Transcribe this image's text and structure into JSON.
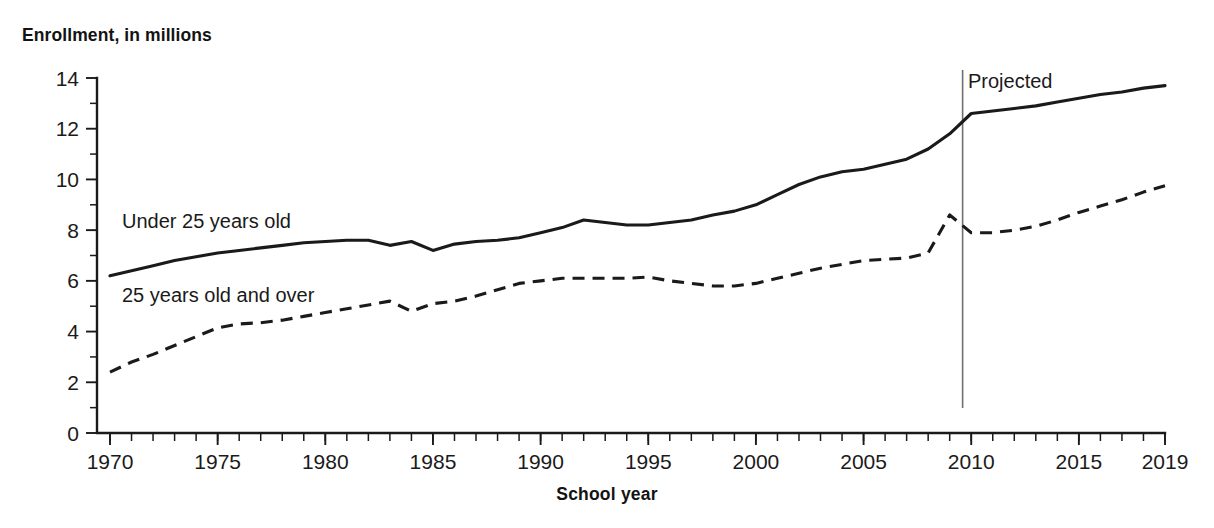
{
  "figure": {
    "cut_off_title_fragment": "",
    "y_axis_title": "Enrollment, in millions",
    "x_axis_title": "School year"
  },
  "annotations": {
    "projected_label": "Projected",
    "projected_divider_year": 2009.6,
    "series_label_under25": "Under 25 years old",
    "series_label_over25": "25 years old and over"
  },
  "colors": {
    "line": "#1a1a1a",
    "divider": "#6f6f6f",
    "background": "#ffffff",
    "text": "#1a1a1a"
  },
  "chart_data": {
    "type": "line",
    "title": "Enrollment, in millions",
    "xlabel": "School year",
    "ylabel": "Enrollment, in millions",
    "xlim": [
      1970,
      2019
    ],
    "ylim": [
      0,
      14
    ],
    "ytick_values": [
      0,
      2,
      4,
      6,
      8,
      10,
      12,
      14
    ],
    "ytick_labels": [
      "0",
      "2",
      "4",
      "6",
      "8",
      "10",
      "12",
      "14"
    ],
    "y_minor_ticks": [
      1,
      3,
      5,
      7,
      9,
      11,
      13
    ],
    "xtick_values": [
      1970,
      1975,
      1980,
      1985,
      1990,
      1995,
      2000,
      2005,
      2010,
      2015,
      2019
    ],
    "xtick_labels": [
      "1970",
      "1975",
      "1980",
      "1985",
      "1990",
      "1995",
      "2000",
      "2005",
      "2010",
      "2015",
      "2019"
    ],
    "x_minor_tick_step": 1,
    "grid": false,
    "legend": "inline-annotations",
    "projected_from": 2009.6,
    "x": [
      1970,
      1971,
      1972,
      1973,
      1974,
      1975,
      1976,
      1977,
      1978,
      1979,
      1980,
      1981,
      1982,
      1983,
      1984,
      1985,
      1986,
      1987,
      1988,
      1989,
      1990,
      1991,
      1992,
      1993,
      1994,
      1995,
      1996,
      1997,
      1998,
      1999,
      2000,
      2001,
      2002,
      2003,
      2004,
      2005,
      2006,
      2007,
      2008,
      2009,
      2010,
      2011,
      2012,
      2013,
      2014,
      2015,
      2016,
      2017,
      2018,
      2019
    ],
    "series": [
      {
        "name": "Under 25 years old",
        "style": "solid",
        "values": [
          6.2,
          6.4,
          6.6,
          6.8,
          6.95,
          7.1,
          7.2,
          7.3,
          7.4,
          7.5,
          7.55,
          7.6,
          7.6,
          7.4,
          7.55,
          7.2,
          7.45,
          7.55,
          7.6,
          7.7,
          7.9,
          8.1,
          8.4,
          8.3,
          8.2,
          8.2,
          8.3,
          8.4,
          8.6,
          8.75,
          9.0,
          9.4,
          9.8,
          10.1,
          10.3,
          10.4,
          10.6,
          10.8,
          11.2,
          11.8,
          12.6,
          12.7,
          12.8,
          12.9,
          13.05,
          13.2,
          13.35,
          13.45,
          13.6,
          13.7
        ]
      },
      {
        "name": "25 years old and over",
        "style": "dashed",
        "values": [
          2.4,
          2.8,
          3.1,
          3.45,
          3.8,
          4.15,
          4.3,
          4.35,
          4.45,
          4.6,
          4.75,
          4.9,
          5.05,
          5.2,
          4.8,
          5.1,
          5.2,
          5.4,
          5.65,
          5.9,
          6.0,
          6.1,
          6.1,
          6.1,
          6.1,
          6.15,
          6.0,
          5.9,
          5.8,
          5.8,
          5.9,
          6.1,
          6.3,
          6.5,
          6.65,
          6.8,
          6.85,
          6.9,
          7.1,
          8.6,
          7.9,
          7.9,
          8.0,
          8.15,
          8.4,
          8.7,
          8.95,
          9.2,
          9.5,
          9.75
        ]
      }
    ]
  }
}
